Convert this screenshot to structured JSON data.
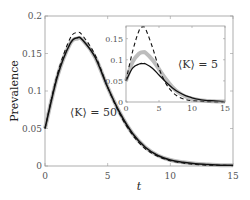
{
  "chart_data": [
    {
      "type": "line",
      "title": "",
      "xlabel": "t",
      "ylabel": "Prevalence",
      "xlim": [
        0,
        15
      ],
      "ylim": [
        0,
        0.2
      ],
      "xticks": [
        "0",
        "5",
        "10",
        "15"
      ],
      "yticks": [
        "0",
        "0.05",
        "0.1",
        "0.15",
        "0.2"
      ],
      "annotation": "⟨K⟩ = 50",
      "grid": false,
      "x": [
        0,
        1,
        2,
        2.6,
        3,
        4,
        5,
        6,
        7,
        8,
        9,
        10,
        11,
        12,
        13,
        14,
        15
      ],
      "series": [
        {
          "name": "simulation (gray band)",
          "values": [
            0.05,
            0.12,
            0.163,
            0.17,
            0.168,
            0.145,
            0.105,
            0.07,
            0.043,
            0.025,
            0.014,
            0.008,
            0.005,
            0.003,
            0.002,
            0.001,
            0.001
          ]
        },
        {
          "name": "solid line",
          "values": [
            0.05,
            0.12,
            0.163,
            0.171,
            0.168,
            0.145,
            0.105,
            0.07,
            0.043,
            0.025,
            0.014,
            0.008,
            0.005,
            0.003,
            0.002,
            0.001,
            0.001
          ]
        },
        {
          "name": "dashed line",
          "values": [
            0.05,
            0.123,
            0.17,
            0.178,
            0.174,
            0.148,
            0.105,
            0.068,
            0.041,
            0.023,
            0.013,
            0.007,
            0.004,
            0.002,
            0.001,
            0.001,
            0.0005
          ]
        }
      ]
    },
    {
      "type": "line",
      "title": "inset",
      "xlabel": "",
      "ylabel": "",
      "xlim": [
        0,
        15
      ],
      "ylim": [
        0,
        0.18
      ],
      "xticks": [
        "0",
        "5",
        "10",
        "15"
      ],
      "yticks": [
        "0",
        "0.05",
        "0.1",
        "0.15"
      ],
      "annotation": "⟨K⟩ = 5",
      "grid": false,
      "x": [
        0,
        1,
        2,
        2.6,
        3,
        4,
        5,
        6,
        7,
        8,
        9,
        10,
        11,
        12,
        13,
        14,
        15
      ],
      "series": [
        {
          "name": "simulation (gray band)",
          "values": [
            0.05,
            0.095,
            0.115,
            0.118,
            0.116,
            0.1,
            0.078,
            0.055,
            0.036,
            0.022,
            0.013,
            0.008,
            0.005,
            0.003,
            0.002,
            0.001,
            0.001
          ]
        },
        {
          "name": "solid line",
          "values": [
            0.05,
            0.08,
            0.09,
            0.091,
            0.09,
            0.08,
            0.064,
            0.048,
            0.034,
            0.023,
            0.015,
            0.01,
            0.006,
            0.004,
            0.003,
            0.002,
            0.001
          ]
        },
        {
          "name": "dashed line",
          "values": [
            0.05,
            0.12,
            0.17,
            0.178,
            0.172,
            0.13,
            0.08,
            0.045,
            0.024,
            0.012,
            0.006,
            0.003,
            0.002,
            0.001,
            0.0005,
            0.0003,
            0.0002
          ]
        }
      ]
    }
  ]
}
